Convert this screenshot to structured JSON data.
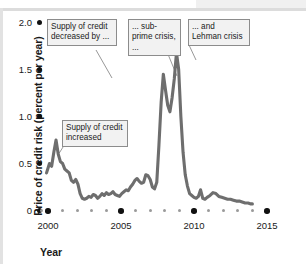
{
  "chart_data": {
    "type": "line",
    "title": "",
    "xlabel": "Year",
    "ylabel": "Price of credit risk (percent per year)",
    "xlim": [
      1999.5,
      2015.3
    ],
    "ylim": [
      0,
      2.0
    ],
    "grid": false,
    "legend": "none",
    "xticks_major": [
      "2000",
      "2005",
      "2010",
      "2015"
    ],
    "xticks_major_values": [
      2000,
      2005,
      2010,
      2015
    ],
    "xticks_minor_values": [
      1999.6,
      2001,
      2002,
      2003,
      2004,
      2006,
      2007,
      2008,
      2009,
      2011,
      2012,
      2013,
      2014
    ],
    "yticks": [
      "0",
      "0.5",
      "1.0",
      "1.5",
      "2.0"
    ],
    "yticks_values": [
      0,
      0.5,
      1.0,
      1.5,
      2.0
    ],
    "series": [
      {
        "name": "Price of credit risk",
        "color": "#6e6e6e",
        "x": [
          1999.9,
          2000.1,
          2000.25,
          2000.4,
          2000.55,
          2000.7,
          2000.85,
          2001.0,
          2001.15,
          2001.3,
          2001.45,
          2001.6,
          2001.75,
          2001.9,
          2002.05,
          2002.2,
          2002.35,
          2002.5,
          2002.65,
          2002.8,
          2002.95,
          2003.1,
          2003.25,
          2003.4,
          2003.55,
          2003.7,
          2003.85,
          2004.0,
          2004.15,
          2004.3,
          2004.45,
          2004.6,
          2004.75,
          2004.9,
          2005.05,
          2005.2,
          2005.35,
          2005.5,
          2005.65,
          2005.8,
          2005.95,
          2006.1,
          2006.25,
          2006.4,
          2006.55,
          2006.7,
          2006.85,
          2007.0,
          2007.15,
          2007.3,
          2007.45,
          2007.6,
          2007.75,
          2007.9,
          2008.05,
          2008.2,
          2008.35,
          2008.5,
          2008.65,
          2008.8,
          2008.95,
          2009.1,
          2009.25,
          2009.4,
          2009.55,
          2009.7,
          2009.85,
          2010.0,
          2010.15,
          2010.3,
          2010.45,
          2010.6,
          2010.75,
          2010.9,
          2011.1,
          2011.3,
          2011.5,
          2011.7,
          2011.9,
          2012.1,
          2012.3,
          2012.5,
          2012.7,
          2012.9,
          2013.1,
          2013.3,
          2013.5,
          2013.7,
          2013.9,
          2014.0
        ],
        "y": [
          0.4,
          0.5,
          0.47,
          0.62,
          0.75,
          0.6,
          0.52,
          0.5,
          0.44,
          0.42,
          0.4,
          0.32,
          0.3,
          0.33,
          0.28,
          0.18,
          0.13,
          0.12,
          0.13,
          0.15,
          0.14,
          0.17,
          0.16,
          0.13,
          0.15,
          0.18,
          0.16,
          0.19,
          0.17,
          0.18,
          0.2,
          0.17,
          0.16,
          0.15,
          0.18,
          0.2,
          0.22,
          0.21,
          0.25,
          0.28,
          0.32,
          0.34,
          0.31,
          0.29,
          0.3,
          0.38,
          0.37,
          0.33,
          0.25,
          0.23,
          0.3,
          0.7,
          1.15,
          1.45,
          1.28,
          1.12,
          1.05,
          1.2,
          1.4,
          1.68,
          1.5,
          1.0,
          0.62,
          0.38,
          0.26,
          0.18,
          0.16,
          0.14,
          0.13,
          0.15,
          0.22,
          0.13,
          0.12,
          0.14,
          0.16,
          0.19,
          0.18,
          0.15,
          0.14,
          0.13,
          0.12,
          0.12,
          0.11,
          0.1,
          0.1,
          0.09,
          0.08,
          0.08,
          0.07,
          0.07
        ]
      }
    ],
    "annotations": [
      {
        "id": "annotation-supply-decreased",
        "text": "Supply of credit decreased by ...",
        "points_to_label": "2007 sub-prime region"
      },
      {
        "id": "annotation-subprime",
        "text": "... sub-prime crisis, ...",
        "points_to_label": "first spike 2007.9"
      },
      {
        "id": "annotation-lehman",
        "text": "... and Lehman crisis",
        "points_to_label": "second spike 2008.8"
      },
      {
        "id": "annotation-supply-increased",
        "text": "Supply of credit increased",
        "points_to_label": "early 2000 decline"
      }
    ]
  },
  "colors": {
    "series": "#6e6e6e",
    "tick_major": "#111111",
    "tick_minor": "#9a9a9a",
    "annotation_bg": "#f2f2f2",
    "annotation_border": "#8c8c8c",
    "text": "#1a1a1a"
  }
}
